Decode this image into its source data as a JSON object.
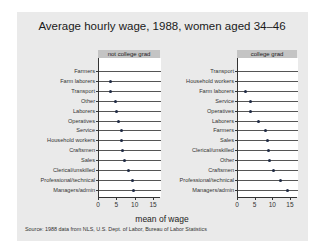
{
  "chart_data": {
    "type": "dot",
    "title": "Average hourly wage, 1988, women aged 34–46",
    "xlabel": "mean of wage",
    "ylabel": "",
    "note": "Source:  1988 data from NLS, U.S. Dept. of Labor, Bureau of Labor Statistics",
    "xlim": [
      0,
      17
    ],
    "xticks": [
      0,
      5,
      10,
      15
    ],
    "grid": true,
    "legend_position": "none",
    "panels": [
      {
        "label": "not college grad",
        "categories": [
          "Farmers",
          "Farm laborers",
          "Transport",
          "Other",
          "Laborers",
          "Operatives",
          "Service",
          "Household workers",
          "Craftsmen",
          "Sales",
          "Clerical/unskilled",
          "Professional/technical",
          "Managers/admin"
        ],
        "values": [
          null,
          3.3,
          3.4,
          4.8,
          5.0,
          5.7,
          6.3,
          6.5,
          6.8,
          7.1,
          8.4,
          9.4,
          9.7
        ]
      },
      {
        "label": "college grad",
        "categories": [
          "Transport",
          "Household workers",
          "Farm laborers",
          "Service",
          "Operatives",
          "Laborers",
          "Farmers",
          "Sales",
          "Clerical/unskilled",
          "Other",
          "Craftsmen",
          "Professional/technical",
          "Managers/admin"
        ],
        "values": [
          null,
          null,
          2.4,
          3.9,
          3.9,
          6.2,
          8.0,
          8.7,
          9.0,
          9.2,
          10.4,
          12.2,
          14.2
        ]
      }
    ]
  },
  "colors": {
    "background": "#eaeaea",
    "plot": "#ffffff",
    "strip": "#c4c4c4",
    "marker": "#1f2a44",
    "grid": "#555555"
  }
}
